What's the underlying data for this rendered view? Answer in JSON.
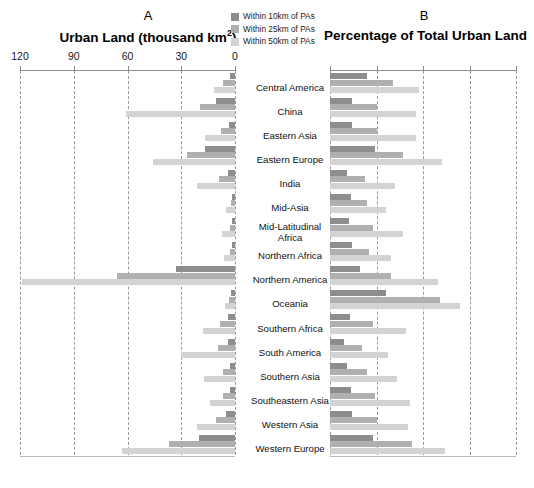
{
  "panels": {
    "a": {
      "letter": "A",
      "title_main": "Urban Land (thousand km",
      "title_sup": "2",
      "title_tail": ")"
    },
    "b": {
      "letter": "B",
      "title": "Percentage of Total Urban Land"
    }
  },
  "legend": {
    "items": [
      {
        "label": "Within 10km of PAs",
        "color": "#8d8d8d",
        "key": "within_10km"
      },
      {
        "label": "Within 25km of PAs",
        "color": "#b0b0b0",
        "key": "within_25km"
      },
      {
        "label": "Within 50km of PAs",
        "color": "#d3d3d3",
        "key": "within_50km"
      }
    ]
  },
  "axis_a": {
    "ticks": [
      "120",
      "90",
      "60",
      "30",
      "0"
    ],
    "values": [
      120,
      90,
      60,
      30,
      0
    ],
    "min": 0,
    "max": 120,
    "reversed": true
  },
  "axis_b": {
    "ticks": [
      "",
      "",
      "",
      "",
      ""
    ],
    "values": [
      0,
      25,
      50,
      75,
      100
    ],
    "min": 0,
    "max": 100,
    "reversed": false
  },
  "categories": [
    "Central America",
    "China",
    "Eastern Asia",
    "Eastern Europe",
    "India",
    "Mid-Asia",
    "Mid-Latitudinal Africa",
    "Northern Africa",
    "Northern America",
    "Oceania",
    "Southern Africa",
    "South America",
    "Southern Asia",
    "Southeastern Asia",
    "Western Asia",
    "Western Europe"
  ],
  "chart_data": [
    {
      "type": "bar",
      "title": "Urban Land (thousand km2)",
      "panel": "A",
      "orientation": "horizontal",
      "direction": "right-to-left",
      "xlabel": "Urban Land (thousand km2)",
      "ylabel": "",
      "xlim": [
        0,
        120
      ],
      "grid": true,
      "categories": [
        "Central America",
        "China",
        "Eastern Asia",
        "Eastern Europe",
        "India",
        "Mid-Asia",
        "Mid-Latitudinal Africa",
        "Northern Africa",
        "Northern America",
        "Oceania",
        "Southern Africa",
        "South America",
        "Southern Asia",
        "Southeastern Asia",
        "Western Asia",
        "Western Europe"
      ],
      "series": [
        {
          "name": "Within 10km of PAs",
          "color": "#8d8d8d",
          "values": [
            3.0,
            10.5,
            3.5,
            17.0,
            4.0,
            1.5,
            1.5,
            1.5,
            33.0,
            2.0,
            4.0,
            4.0,
            3.0,
            3.0,
            5.0,
            20.0
          ]
        },
        {
          "name": "Within 25km of PAs",
          "color": "#b0b0b0",
          "values": [
            6.5,
            19.5,
            8.0,
            27.0,
            9.0,
            2.5,
            3.0,
            3.0,
            66.0,
            3.5,
            8.5,
            9.5,
            7.0,
            6.5,
            10.5,
            37.0
          ]
        },
        {
          "name": "Within 50km of PAs",
          "color": "#d3d3d3",
          "values": [
            12.0,
            61.0,
            17.0,
            46.0,
            21.0,
            5.0,
            7.5,
            6.0,
            119.0,
            5.5,
            18.0,
            30.0,
            17.5,
            14.0,
            21.0,
            63.0
          ]
        }
      ]
    },
    {
      "type": "bar",
      "title": "Percentage of Total Urban Land",
      "panel": "B",
      "orientation": "horizontal",
      "direction": "left-to-right",
      "xlabel": "Percentage of Total Urban Land",
      "ylabel": "",
      "xlim": [
        0,
        100
      ],
      "grid": true,
      "categories": [
        "Central America",
        "China",
        "Eastern Asia",
        "Eastern Europe",
        "India",
        "Mid-Asia",
        "Mid-Latitudinal Africa",
        "Northern Africa",
        "Northern America",
        "Oceania",
        "Southern Africa",
        "South America",
        "Southern Asia",
        "Southeastern Asia",
        "Western Asia",
        "Western Europe"
      ],
      "series": [
        {
          "name": "Within 10km of PAs",
          "color": "#8d8d8d",
          "values": [
            20.0,
            12.0,
            12.0,
            24.0,
            9.0,
            11.0,
            10.0,
            12.0,
            16.0,
            30.0,
            10.5,
            7.5,
            9.0,
            11.0,
            12.0,
            23.0
          ]
        },
        {
          "name": "Within 25km of PAs",
          "color": "#b0b0b0",
          "values": [
            34.0,
            25.0,
            25.0,
            39.0,
            19.0,
            20.0,
            23.0,
            21.0,
            33.0,
            59.0,
            23.0,
            17.0,
            20.0,
            24.0,
            25.0,
            44.0
          ]
        },
        {
          "name": "Within 50km of PAs",
          "color": "#d3d3d3",
          "values": [
            48.0,
            46.0,
            46.0,
            60.0,
            35.0,
            30.0,
            39.0,
            33.0,
            58.0,
            70.0,
            41.0,
            31.0,
            36.0,
            43.0,
            42.0,
            62.0
          ]
        }
      ]
    }
  ]
}
